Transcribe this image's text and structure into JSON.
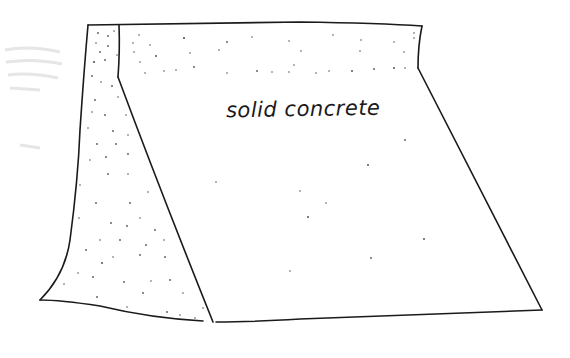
{
  "diagram": {
    "title": "",
    "label": "solid concrete",
    "style": "hand-drawn ink sketch",
    "colors": {
      "ink": "#1a1a1a",
      "background": "#ffffff",
      "stipple": "#555555"
    },
    "shape": {
      "description": "Dam/wall cross-section: stippled narrow left face (trapezoid strip), plain sloping main face, stippled top band",
      "outline_points": [
        [
          88,
          25
        ],
        [
          422,
          26
        ],
        [
          418,
          68
        ],
        [
          542,
          310
        ],
        [
          213,
          322
        ],
        [
          40,
          300
        ]
      ],
      "inner_lines": [
        {
          "from": [
            119,
            25
          ],
          "to": [
            119,
            77
          ]
        },
        {
          "from": [
            119,
            77
          ],
          "to": [
            213,
            322
          ]
        },
        {
          "from": [
            119,
            75
          ],
          "to": [
            418,
            68
          ]
        }
      ]
    }
  }
}
